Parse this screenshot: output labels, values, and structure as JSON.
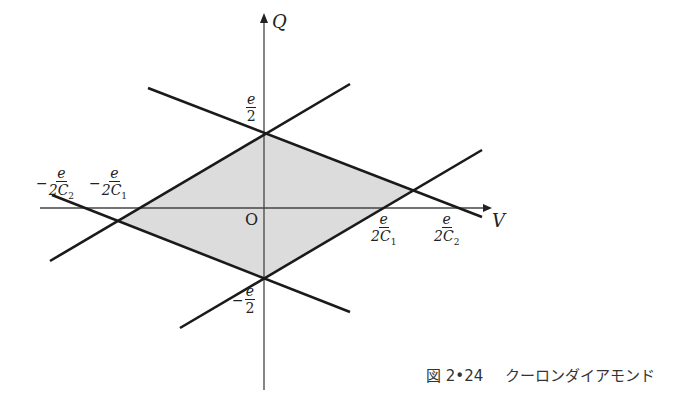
{
  "diagram": {
    "type": "coulomb-diamond",
    "axes": {
      "x_label": "V",
      "y_label": "Q",
      "origin_label": "O"
    },
    "tick_labels": {
      "q_top": {
        "sign": "",
        "num": "e",
        "den": "2",
        "sub": ""
      },
      "q_bottom": {
        "sign": "−",
        "num": "e",
        "den": "2",
        "sub": ""
      },
      "v_neg_c2": {
        "sign": "−",
        "num": "e",
        "den": "2C",
        "sub": "2"
      },
      "v_neg_c1": {
        "sign": "−",
        "num": "e",
        "den": "2C",
        "sub": "1"
      },
      "v_pos_c1": {
        "sign": "",
        "num": "e",
        "den": "2C",
        "sub": "1"
      },
      "v_pos_c2": {
        "sign": "",
        "num": "e",
        "den": "2C",
        "sub": "2"
      }
    },
    "diamond_vertices": {
      "top": [
        264,
        133
      ],
      "right": [
        412,
        190
      ],
      "bottom": [
        264,
        277
      ],
      "left": [
        119,
        221
      ]
    },
    "colors": {
      "fill": "#dcdcdc",
      "line": "#1a1a1a",
      "axis": "#444444"
    }
  },
  "caption": {
    "number": "図 2•24",
    "title": "クーロンダイアモンド"
  }
}
